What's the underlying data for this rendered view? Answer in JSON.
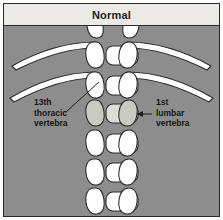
{
  "figure": {
    "title": "Normal",
    "background_color": "#8d8d8d",
    "header_color": "#eceae6",
    "border_color": "#2b2b2b",
    "bone_color": "#ffffff",
    "bone_outline_color": "#2b2b2b",
    "highlight_bone_color": "#c9cbc0",
    "label_color": "#151515"
  },
  "labels": {
    "left": {
      "line1": "13th",
      "line2": "thoracic",
      "line3": "vertebra",
      "text": "13th\nthoracic\nvertebra"
    },
    "right": {
      "line1": "1st",
      "line2": "lumbar",
      "line3": "vertebra",
      "text": "1st\nlumbar\nvertebra"
    }
  },
  "anatomy": {
    "type": "spine-radiograph-diagram",
    "view": "dorsoventral",
    "structures": [
      "13th thoracic vertebra",
      "1st lumbar vertebra",
      "ribs",
      "vertebral bodies",
      "transverse processes"
    ],
    "rib_pairs": 2,
    "vertebra_rows": 7,
    "highlighted_row_index": 2
  }
}
